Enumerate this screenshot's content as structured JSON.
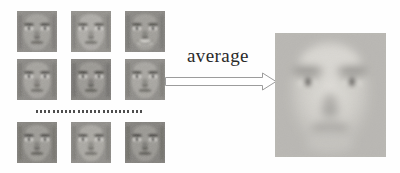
{
  "figure": {
    "background_color": "#fefefe",
    "width": 400,
    "height": 173
  },
  "label": {
    "text": "average",
    "color": "#2a2a2a"
  },
  "arrow": {
    "name": "block-arrow-right",
    "outline_color": "#9a9a9a",
    "fill_color": "#ffffff",
    "direction": "right"
  },
  "ellipsis": {
    "name": "vertical-continuation-dots",
    "dot_count": 26,
    "dot_color": "#4e4e4e"
  },
  "grid": {
    "rows": 3,
    "columns": 3,
    "thumbnails": [
      {
        "id": "face-r1c1",
        "label": "face thumbnail row 1 column 1",
        "x": 17,
        "y": 11,
        "tone": "#8e8c88",
        "skin": "#a3a19c",
        "brow": "#4b4944",
        "mouth": "#6a6862",
        "expression": "neutral"
      },
      {
        "id": "face-r1c2",
        "label": "face thumbnail row 1 column 2",
        "x": 71,
        "y": 11,
        "tone": "#93918c",
        "skin": "#aeaca7",
        "brow": "#55534e",
        "mouth": "#706e68",
        "expression": "neutral"
      },
      {
        "id": "face-r1c3",
        "label": "face thumbnail row 1 column 3",
        "x": 125,
        "y": 11,
        "tone": "#8a8884",
        "skin": "#a09e99",
        "brow": "#4a4843",
        "mouth": "#cfcdc8",
        "expression": "smiling"
      },
      {
        "id": "face-r2c1",
        "label": "face thumbnail row 2 column 1",
        "x": 17,
        "y": 59,
        "tone": "#8b8985",
        "skin": "#a5a39e",
        "brow": "#4f4d48",
        "mouth": "#6e6c66",
        "expression": "neutral"
      },
      {
        "id": "face-r2c2",
        "label": "face thumbnail row 2 column 2",
        "x": 71,
        "y": 59,
        "tone": "#85837f",
        "skin": "#9b9994",
        "brow": "#3f3d38",
        "mouth": "#5f5d57",
        "expression": "neutral"
      },
      {
        "id": "face-r2c3",
        "label": "face thumbnail row 2 column 3",
        "x": 125,
        "y": 59,
        "tone": "#8f8d89",
        "skin": "#a8a6a1",
        "brow": "#4d4b46",
        "mouth": "#6c6a64",
        "expression": "neutral"
      },
      {
        "id": "face-r3c1",
        "label": "face thumbnail row 3 column 1",
        "x": 17,
        "y": 122,
        "tone": "#86847f",
        "skin": "#9d9b96",
        "brow": "#454340",
        "mouth": "#5d5b55",
        "expression": "neutral"
      },
      {
        "id": "face-r3c2",
        "label": "face thumbnail row 3 column 2",
        "x": 71,
        "y": 122,
        "tone": "#908e8a",
        "skin": "#aaa8a3",
        "brow": "#504e49",
        "mouth": "#6f6d67",
        "expression": "neutral"
      },
      {
        "id": "face-r3c3",
        "label": "face thumbnail row 3 column 3",
        "x": 125,
        "y": 122,
        "tone": "#83817d",
        "skin": "#9a9893",
        "brow": "#3d3b37",
        "mouth": "#5a5852",
        "expression": "neutral"
      }
    ]
  },
  "average_face": {
    "id": "average-face-result",
    "label": "averaged face image",
    "x": 275,
    "y": 33,
    "width": 111,
    "height": 124,
    "base_tone": "#c9c7c3",
    "shadow_tone": "#a9a7a3",
    "iris_color": "#5c5a56"
  }
}
